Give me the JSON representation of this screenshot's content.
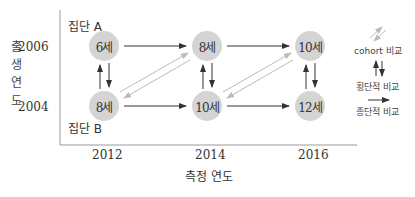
{
  "diagram": {
    "y_axis": {
      "label": "출생 연도",
      "ticks": [
        "2006",
        "2004"
      ]
    },
    "x_axis": {
      "label": "측정 연도",
      "ticks": [
        "2012",
        "2014",
        "2016"
      ]
    },
    "groups": {
      "top": "집단 A",
      "bottom": "집단 B"
    },
    "nodes": {
      "top": [
        "6세",
        "8세",
        "10세"
      ],
      "bottom": [
        "8세",
        "10세",
        "12세"
      ]
    },
    "legend": {
      "cohort": "cohort 비교",
      "cross": "횡단적 비교",
      "longitudinal": "종단적 비교"
    },
    "colors": {
      "node_fill": "#d4d4d4",
      "arrow_dark": "#333333",
      "arrow_light": "#bbbbbb",
      "axis": "#999999"
    }
  }
}
